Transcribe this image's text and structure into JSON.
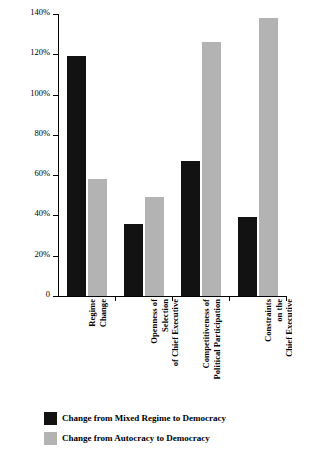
{
  "chart_data": {
    "type": "bar",
    "title": "",
    "xlabel": "",
    "ylabel": "Change in Probability of War",
    "ylim": [
      0,
      140
    ],
    "grid": false,
    "legend_position": "bottom-left",
    "ytick_labels": [
      "0",
      "20%",
      "40%",
      "60%",
      "80%",
      "100%",
      "120%",
      "140%"
    ],
    "ytick_values": [
      0,
      20,
      40,
      60,
      80,
      100,
      120,
      140
    ],
    "categories": [
      "Regime Change",
      "Openness of Selection of Chief Executive",
      "Competitiveness of Political Participation",
      "Constraints on the Chief Executive"
    ],
    "category_label_lines": [
      [
        "Regime",
        "Change"
      ],
      [
        "Openness of",
        "Selection",
        "of Chief Executive"
      ],
      [
        "Competitiveness of",
        "Political Participation"
      ],
      [
        "Constraints",
        "on the",
        "Chief Executive"
      ]
    ],
    "series": [
      {
        "name": "Change from Mixed Regime to Democracy",
        "color": "#121212",
        "values": [
          119,
          36,
          67,
          39
        ]
      },
      {
        "name": "Change from Autocracy to Democracy",
        "color": "#b3b3b3",
        "values": [
          58,
          49,
          126,
          138
        ]
      }
    ]
  },
  "axis": {
    "y_title": "Change in Probability of War"
  },
  "legend": {
    "items": [
      {
        "label": "Change from Mixed Regime to Democracy",
        "color": "#121212"
      },
      {
        "label": "Change from Autocracy to Democracy",
        "color": "#b3b3b3"
      }
    ]
  }
}
